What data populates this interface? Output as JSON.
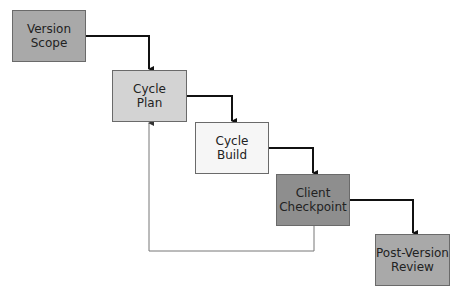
{
  "diagram": {
    "type": "waterfall-flow",
    "nodes": [
      {
        "id": "version-scope",
        "label": "Version\nScope",
        "fill": "#a9a9a9"
      },
      {
        "id": "cycle-plan",
        "label": "Cycle\nPlan",
        "fill": "#d3d3d3"
      },
      {
        "id": "cycle-build",
        "label": "Cycle\nBuild",
        "fill": "#f6f6f6"
      },
      {
        "id": "client-checkpoint",
        "label": "Client\nCheckpoint",
        "fill": "#8e8e8e"
      },
      {
        "id": "post-version-review",
        "label": "Post-Version\nReview",
        "fill": "#a9a9a9"
      }
    ],
    "edges": [
      {
        "from": "version-scope",
        "to": "cycle-plan",
        "style": "thick"
      },
      {
        "from": "cycle-plan",
        "to": "cycle-build",
        "style": "thick"
      },
      {
        "from": "cycle-build",
        "to": "client-checkpoint",
        "style": "thick"
      },
      {
        "from": "client-checkpoint",
        "to": "post-version-review",
        "style": "thick"
      },
      {
        "from": "client-checkpoint",
        "to": "cycle-plan",
        "style": "thin-feedback"
      }
    ]
  }
}
